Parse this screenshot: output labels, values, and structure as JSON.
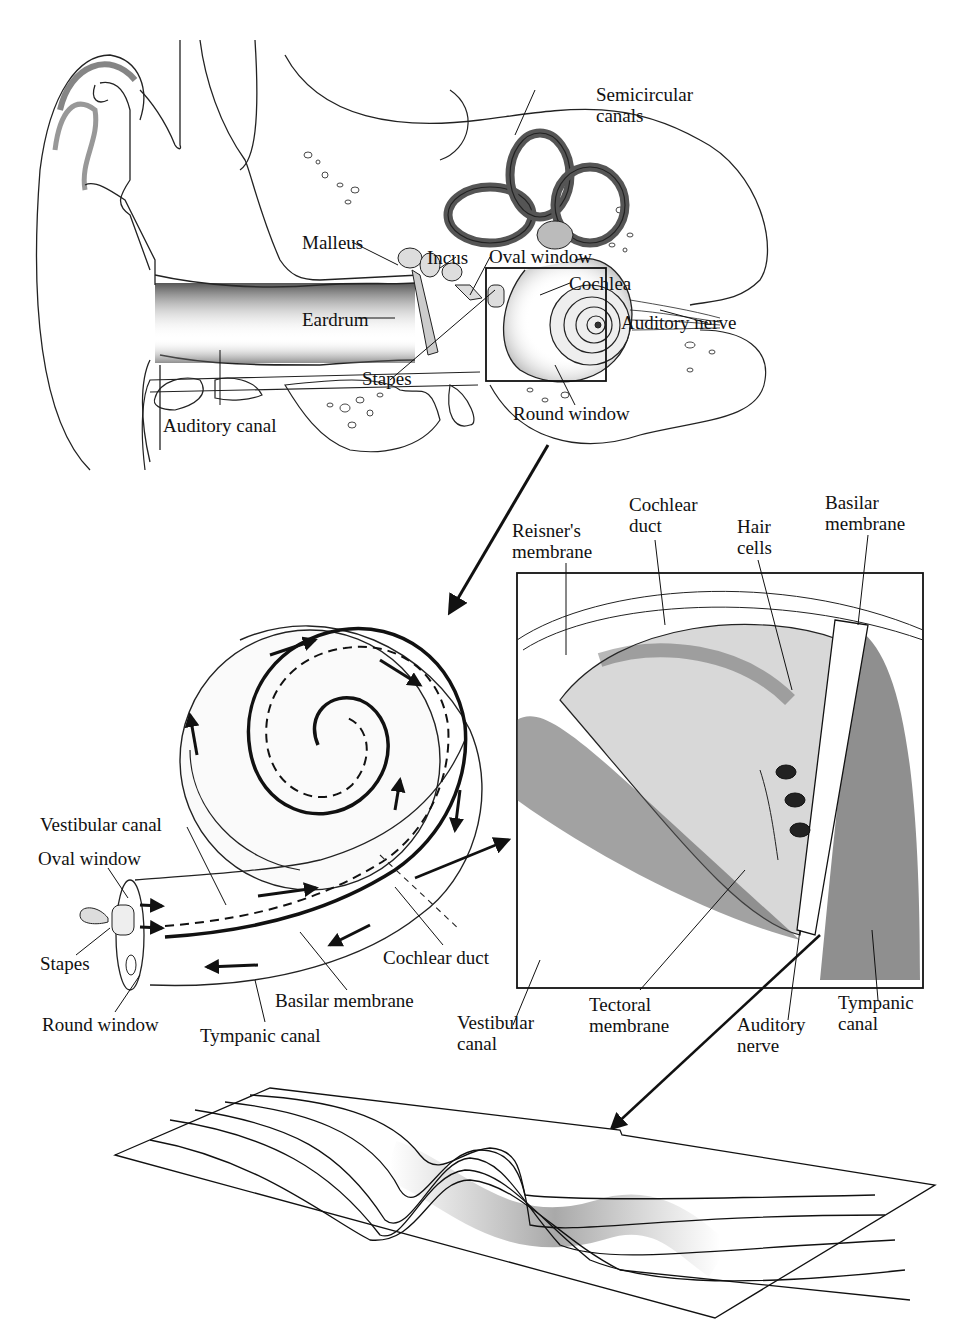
{
  "figure": {
    "panels": [
      {
        "id": "outer-middle-inner-ear",
        "labels": {
          "semicircular_canals": "Semicircular canals",
          "semicircular_l1": "Semicircular",
          "semicircular_l2": "canals",
          "malleus": "Malleus",
          "incus": "Incus",
          "oval_window": "Oval window",
          "cochlea": "Cochlea",
          "eardrum": "Eardrum",
          "auditory_nerve": "Auditory nerve",
          "stapes": "Stapes",
          "round_window": "Round window",
          "auditory_canal": "Auditory canal"
        }
      },
      {
        "id": "uncoiled-cochlea",
        "labels": {
          "vestibular_canal": "Vestibular canal",
          "oval_window": "Oval window",
          "stapes": "Stapes",
          "round_window": "Round window",
          "tympanic_canal": "Tympanic canal",
          "basilar_membrane": "Basilar membrane",
          "cochlear_duct": "Cochlear duct"
        }
      },
      {
        "id": "cochlea-cross-section",
        "labels": {
          "reisners_l1": "Reisner's",
          "reisners_l2": "membrane",
          "cochlear_duct_l1": "Cochlear",
          "cochlear_duct_l2": "duct",
          "hair_l1": "Hair",
          "hair_l2": "cells",
          "basilar_l1": "Basilar",
          "basilar_l2": "membrane",
          "vestibular_l1": "Vestibular",
          "vestibular_l2": "canal",
          "tectoral_l1": "Tectoral",
          "tectoral_l2": "membrane",
          "auditory_l1": "Auditory",
          "auditory_l2": "nerve",
          "tympanic_l1": "Tympanic",
          "tympanic_l2": "canal"
        }
      },
      {
        "id": "basilar-membrane-traveling-wave",
        "labels": {}
      }
    ]
  }
}
